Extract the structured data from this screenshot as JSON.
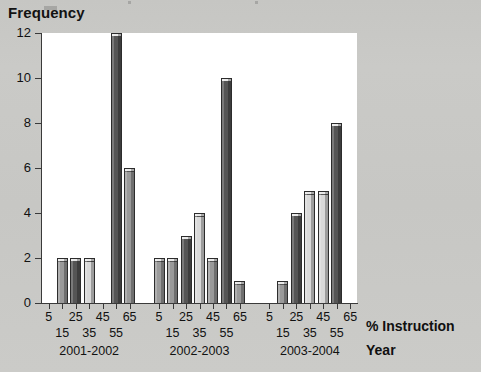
{
  "chart_data": {
    "type": "bar",
    "title": "",
    "xlabel": "% Instruction",
    "grouplabel": "Year",
    "ylabel": "Frequency",
    "ylim": [
      0,
      12
    ],
    "yticks": [
      0,
      2,
      4,
      6,
      8,
      10,
      12
    ],
    "ytick_labels": [
      "0",
      "2",
      "4",
      "6",
      "8",
      "10",
      "12"
    ],
    "grid": false,
    "legend": "none",
    "categories": [
      "5",
      "15",
      "25",
      "35",
      "45",
      "55",
      "65"
    ],
    "groups": [
      "2001-2002",
      "2002-2003",
      "2003-2004"
    ],
    "series": [
      {
        "name": "2001-2002",
        "values": [
          0,
          2,
          2,
          2,
          0,
          12,
          6
        ]
      },
      {
        "name": "2002-2003",
        "values": [
          2,
          2,
          3,
          4,
          2,
          10,
          1
        ]
      },
      {
        "name": "2003-2004",
        "values": [
          0,
          1,
          4,
          5,
          5,
          8,
          0
        ]
      }
    ],
    "bars": [
      {
        "group": "2001-2002",
        "x": "15",
        "value": 2,
        "tone": "mid"
      },
      {
        "group": "2001-2002",
        "x": "25",
        "value": 2,
        "tone": "dark"
      },
      {
        "group": "2001-2002",
        "x": "35",
        "value": 2,
        "tone": "light"
      },
      {
        "group": "2001-2002",
        "x": "55",
        "value": 12,
        "tone": "dark"
      },
      {
        "group": "2001-2002",
        "x": "65",
        "value": 6,
        "tone": "mid"
      },
      {
        "group": "2002-2003",
        "x": "5",
        "value": 2,
        "tone": "mid"
      },
      {
        "group": "2002-2003",
        "x": "15",
        "value": 2,
        "tone": "mid"
      },
      {
        "group": "2002-2003",
        "x": "25",
        "value": 3,
        "tone": "dark"
      },
      {
        "group": "2002-2003",
        "x": "35",
        "value": 4,
        "tone": "light"
      },
      {
        "group": "2002-2003",
        "x": "45",
        "value": 2,
        "tone": "mid"
      },
      {
        "group": "2002-2003",
        "x": "55",
        "value": 10,
        "tone": "dark"
      },
      {
        "group": "2002-2003",
        "x": "65",
        "value": 1,
        "tone": "mid"
      },
      {
        "group": "2003-2004",
        "x": "15",
        "value": 1,
        "tone": "mid"
      },
      {
        "group": "2003-2004",
        "x": "25",
        "value": 4,
        "tone": "dark"
      },
      {
        "group": "2003-2004",
        "x": "35",
        "value": 5,
        "tone": "light"
      },
      {
        "group": "2003-2004",
        "x": "45",
        "value": 5,
        "tone": "light"
      },
      {
        "group": "2003-2004",
        "x": "55",
        "value": 8,
        "tone": "dark"
      }
    ],
    "colors": {
      "plot_background": "#ffffff",
      "page_background": "#c8c8c5",
      "axis": "#3a3a3a",
      "bar_light": "#d9d9d9",
      "bar_mid": "#9a9a9a",
      "bar_dark": "#555555",
      "text": "#111111"
    }
  }
}
